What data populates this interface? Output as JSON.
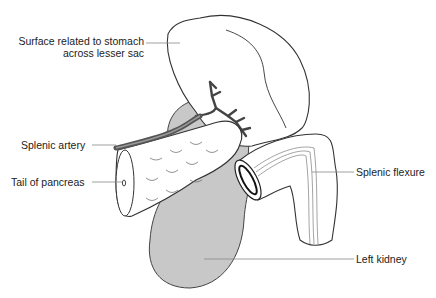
{
  "diagram": {
    "colors": {
      "background": "#ffffff",
      "outline": "#333333",
      "kidney_fill": "#c8c8c8",
      "artery_fill": "#555555",
      "leader_line": "#888888"
    },
    "labels": [
      {
        "id": "stomach-surface",
        "line1": "Surface related to stomach",
        "line2": "across lesser sac",
        "side": "left"
      },
      {
        "id": "splenic-artery",
        "line1": "Splenic artery",
        "side": "left"
      },
      {
        "id": "tail-of-pancreas",
        "line1": "Tail of pancreas",
        "side": "left"
      },
      {
        "id": "splenic-flexure",
        "line1": "Splenic flexure",
        "side": "right"
      },
      {
        "id": "left-kidney",
        "line1": "Left kidney",
        "side": "right"
      }
    ]
  }
}
